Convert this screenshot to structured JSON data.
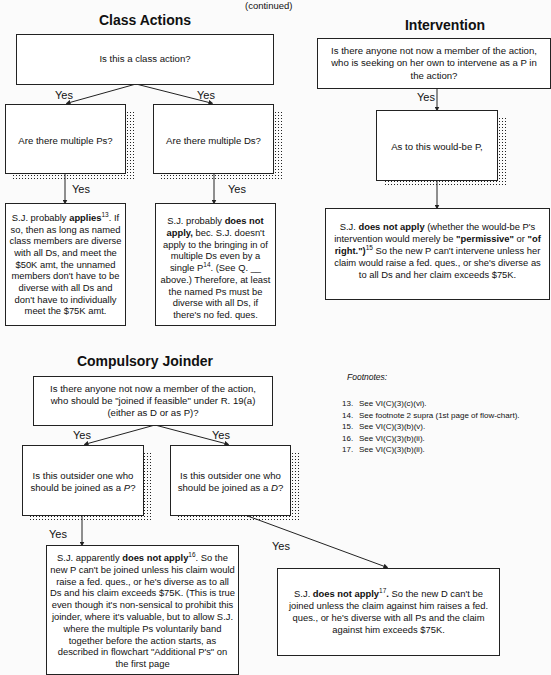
{
  "page": {
    "continued_label": "(continued)"
  },
  "class_actions": {
    "title": "Class Actions",
    "question": "Is this a class action?",
    "yes_left": "Yes",
    "yes_right": "Yes",
    "multiple_ps": "Are there multiple Ps?",
    "multiple_ds": "Are there multiple Ds?",
    "yes_ps": "Yes",
    "yes_ds": "Yes",
    "ps_result": {
      "pre": "S.J. probably ",
      "bold": "applies",
      "sup": "13",
      "post": ". If so, then as long as named class members are diverse with all Ds, and meet the $50K amt, the unnamed members don't have to be diverse with all Ds and don't have to individually meet the $75K amt."
    },
    "ds_result": {
      "pre": "S.J. probably ",
      "bold": "does not apply,",
      "mid": " bec. S.J. doesn't apply to the bringing in of multiple Ds even by a single P",
      "sup": "14",
      "post": ". (See Q. __ above.) Therefore, at least the named Ps must be diverse with all Ds, if there's no fed. ques."
    }
  },
  "intervention": {
    "title": "Intervention",
    "question": "Is there anyone not now a member of the action, who is seeking on her own to intervene as a P in the action?",
    "yes": "Yes",
    "would_be": "As to this would-be P,",
    "result": {
      "pre": "S.J. ",
      "bold1": "does not apply",
      "mid1": " (whether the would-be P's intervention would merely be ",
      "bold2": "\"permissive\"",
      "mid2": " or ",
      "bold3": "\"of right.\")",
      "sup": "15",
      "post": " So the new P can't intervene unless her claim would raise a fed. ques., or she's diverse as to all Ds and her claim exceeds $75K."
    }
  },
  "compulsory_joinder": {
    "title": "Compulsory Joinder",
    "question": "Is there anyone not now a member of the action, who should be \"joined if feasible\" under R. 19(a) (either as D or as P)?",
    "yes_left": "Yes",
    "yes_right": "Yes",
    "as_p": {
      "pre": "Is this outsider one who should be joined as a ",
      "ital": "P",
      "post": "?"
    },
    "as_d": {
      "pre": "Is this outsider one who should be joined as a ",
      "ital": "D",
      "post": "?"
    },
    "yes_p": "Yes",
    "yes_d": "Yes",
    "p_result": {
      "pre": "S.J. apparently  ",
      "bold": "does not apply",
      "sup": "16",
      "post": ". So the new P can't be joined unless his claim would raise a fed. ques., or he's diverse as to all Ds and his claim exceeds $75K. (This is true even though it's non-sensical to prohibit this joinder, where it's valuable, but to allow S.J. where the multiple Ps voluntarily band together before the action starts, as described in flowchart \"Additional P's\" on the first page"
    },
    "d_result": {
      "pre": "S.J. ",
      "bold": "does not apply",
      "sup": "17",
      "bold2": ".",
      "post": " So the new D can't be joined unless the claim against him raises a fed. ques., or he's diverse with all Ps and the claim against him exceeds $75K."
    }
  },
  "footnotes": {
    "title": "Footnotes:",
    "items": [
      {
        "num": "13.",
        "text": "See VI(C)(3)(c)(vi)."
      },
      {
        "num": "14.",
        "text": "See footnote 2 supra (1st page of flow-chart)."
      },
      {
        "num": "15.",
        "text": "See VI(C)(3)(b)(v)."
      },
      {
        "num": "16.",
        "text": "See VI(C)(3)(b)(ii)."
      },
      {
        "num": "17.",
        "text": "See VI(C)(3)(b)(ii)."
      }
    ]
  }
}
